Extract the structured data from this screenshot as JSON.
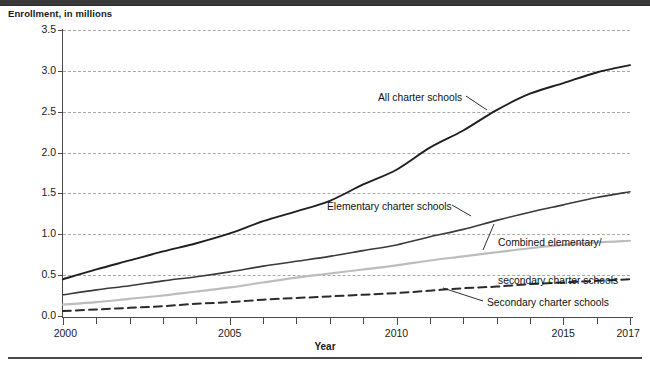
{
  "figure": {
    "y_axis_caption": "Enrollment, in millions",
    "x_axis_title": "Year"
  },
  "chart_data": {
    "type": "line",
    "title": "",
    "xlabel": "Year",
    "ylabel": "Enrollment, in millions",
    "xlim": [
      2000,
      2017
    ],
    "ylim": [
      0.0,
      3.5
    ],
    "grid": true,
    "legend_position": "inline-annotations",
    "x": [
      2000,
      2001,
      2002,
      2003,
      2004,
      2005,
      2006,
      2007,
      2008,
      2009,
      2010,
      2011,
      2012,
      2013,
      2014,
      2015,
      2016,
      2017
    ],
    "x_tick_labels": [
      "2000",
      "2005",
      "2010",
      "2015",
      "2017"
    ],
    "x_tick_values": [
      2000,
      2005,
      2010,
      2015,
      2017
    ],
    "y_tick_labels": [
      "0.0",
      "0.5",
      "1.0",
      "1.5",
      "2.0",
      "2.5",
      "3.0",
      "3.5"
    ],
    "y_tick_values": [
      0.0,
      0.5,
      1.0,
      1.5,
      2.0,
      2.5,
      3.0,
      3.5
    ],
    "series": [
      {
        "name": "All charter schools",
        "style": "solid",
        "color": "#1f1f1f",
        "width": 1.9,
        "values": [
          0.45,
          0.57,
          0.68,
          0.79,
          0.89,
          1.01,
          1.16,
          1.28,
          1.41,
          1.61,
          1.79,
          2.06,
          2.27,
          2.52,
          2.72,
          2.85,
          2.98,
          3.07
        ]
      },
      {
        "name": "Elementary charter schools",
        "style": "solid",
        "color": "#3a3a3a",
        "width": 1.6,
        "values": [
          0.26,
          0.32,
          0.37,
          0.43,
          0.48,
          0.54,
          0.61,
          0.67,
          0.73,
          0.8,
          0.87,
          0.97,
          1.06,
          1.17,
          1.27,
          1.36,
          1.45,
          1.52
        ]
      },
      {
        "name": "Combined elementary/\nsecondary charter schools",
        "style": "solid",
        "color": "#bcbcbc",
        "width": 2.1,
        "values": [
          0.14,
          0.17,
          0.21,
          0.25,
          0.3,
          0.35,
          0.41,
          0.47,
          0.52,
          0.57,
          0.62,
          0.68,
          0.73,
          0.78,
          0.83,
          0.87,
          0.9,
          0.92
        ]
      },
      {
        "name": "Secondary charter schools",
        "style": "dashed",
        "color": "#2b2b2b",
        "width": 2.0,
        "values": [
          0.06,
          0.08,
          0.1,
          0.12,
          0.15,
          0.17,
          0.2,
          0.22,
          0.24,
          0.26,
          0.28,
          0.31,
          0.34,
          0.36,
          0.39,
          0.41,
          0.43,
          0.45
        ]
      }
    ],
    "annotations": [
      {
        "text": "All charter schools",
        "series": "All charter schools"
      },
      {
        "text": "Elementary charter schools",
        "series": "Elementary charter schools"
      },
      {
        "text": "Combined elementary/",
        "series": "Combined elementary/\nsecondary charter schools"
      },
      {
        "text": "secondary charter schools",
        "series": "Combined elementary/\nsecondary charter schools"
      },
      {
        "text": "Secondary charter schools",
        "series": "Secondary charter schools"
      }
    ]
  },
  "annotation_labels": {
    "all": "All charter schools",
    "elementary": "Elementary charter schools",
    "combined_line1": "Combined elementary/",
    "combined_line2": "secondary charter schools",
    "secondary": "Secondary charter schools"
  }
}
